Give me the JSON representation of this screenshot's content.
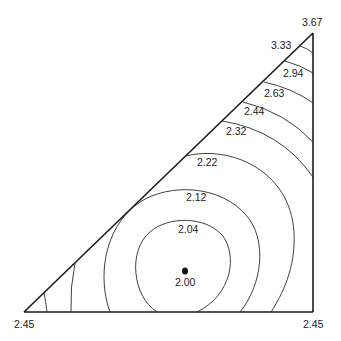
{
  "diagram": {
    "type": "ternary-contour-plot",
    "corners": {
      "bottom_left": "2.45",
      "bottom_right": "2.45",
      "top": "3.67"
    },
    "contour_labels": [
      {
        "id": "c333",
        "value": "3.33"
      },
      {
        "id": "c294",
        "value": "2.94"
      },
      {
        "id": "c263",
        "value": "2.63"
      },
      {
        "id": "c244",
        "value": "2.44"
      },
      {
        "id": "c232",
        "value": "2.32"
      },
      {
        "id": "c222",
        "value": "2.22"
      },
      {
        "id": "c212",
        "value": "2.12"
      },
      {
        "id": "c204",
        "value": "2.04"
      }
    ],
    "minimum": {
      "value": "2.00",
      "marker": "filled-dot"
    },
    "colors": {
      "lines": "#1a1a1a",
      "background": "#ffffff"
    }
  }
}
